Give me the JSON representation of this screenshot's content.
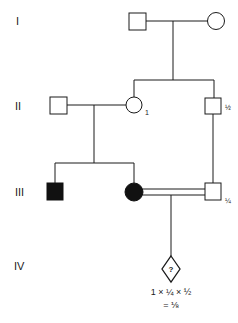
{
  "diagram": {
    "type": "pedigree",
    "colors": {
      "line": "#1a1a1a",
      "affected": "#111111",
      "background": "#ffffff"
    },
    "generations": [
      {
        "label": "I"
      },
      {
        "label": "II"
      },
      {
        "label": "III"
      },
      {
        "label": "IV"
      }
    ],
    "individuals": {
      "I_father": {
        "sex": "male",
        "affected": false
      },
      "I_mother": {
        "sex": "female",
        "affected": false
      },
      "II_husband": {
        "sex": "male",
        "affected": false
      },
      "II_wife": {
        "sex": "female",
        "affected": false,
        "annotation": "1"
      },
      "II_son": {
        "sex": "male",
        "affected": false,
        "annotation": "½"
      },
      "III_son": {
        "sex": "male",
        "affected": true
      },
      "III_daughter": {
        "sex": "female",
        "affected": true
      },
      "III_cousin": {
        "sex": "male",
        "affected": false,
        "annotation": "¼"
      },
      "IV_child": {
        "sex": "unknown",
        "affected": null,
        "symbol_text": "?"
      }
    },
    "consanguineous_mating": "III_daughter x III_cousin (double line)",
    "calculation": {
      "line1": "1 × ¼ × ½",
      "line2": "= ⅛"
    }
  }
}
